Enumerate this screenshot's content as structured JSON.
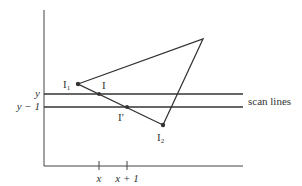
{
  "diagram": {
    "type": "scanline-triangle-edge-coherence",
    "colors": {
      "stroke": "#333333",
      "axis": "#444444",
      "background": "#ffffff"
    },
    "vertices": {
      "I1": {
        "label": "I",
        "sub": "1",
        "x": 78,
        "y": 84
      },
      "top": {
        "x": 203,
        "y": 39
      },
      "I2": {
        "label": "I",
        "sub": "2",
        "x": 163,
        "y": 125
      }
    },
    "intersections": {
      "I": {
        "label": "I",
        "x": 99,
        "y": 94
      },
      "Iprime": {
        "label": "I′",
        "x": 127,
        "y": 107
      }
    },
    "scan_lines": {
      "label": "scan lines",
      "y_label": "y",
      "y_minus_1_label": "y − 1"
    },
    "x_ticks": {
      "x_label": "x",
      "x_plus_1_label": "x + 1"
    }
  }
}
